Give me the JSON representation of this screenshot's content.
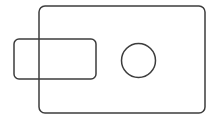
{
  "canvas": {
    "width": 214,
    "height": 124,
    "background_color": "#ffffff",
    "title": "Technical line drawing"
  },
  "style": {
    "stroke_color": "#3c3c3c",
    "stroke_width": 1.5,
    "fill": "none",
    "hidden_line_removal": false
  },
  "shapes": [
    {
      "name": "large-rounded-rectangle",
      "type": "rounded-rect",
      "x": 39,
      "y": 6,
      "width": 166,
      "height": 107,
      "corner_radius": 6
    },
    {
      "name": "small-rounded-rectangle",
      "type": "rounded-rect",
      "x": 14,
      "y": 39,
      "width": 82,
      "height": 40,
      "corner_radius": 5
    },
    {
      "name": "circle-hole",
      "type": "circle",
      "cx": 138.5,
      "cy": 60.5,
      "r": 17
    }
  ]
}
